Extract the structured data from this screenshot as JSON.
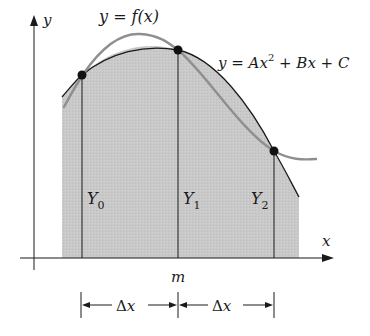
{
  "diagram": {
    "labels": {
      "y_axis": "y",
      "x_axis": "x",
      "function_label": "y = f(x)",
      "parabola_label_prefix": "y = Ax",
      "parabola_label_exp": "2",
      "parabola_label_suffix": " + Bx + C",
      "midpoint": "m",
      "ordinate_0": "Y",
      "ordinate_0_sub": "0",
      "ordinate_1": "Y",
      "ordinate_1_sub": "1",
      "ordinate_2": "Y",
      "ordinate_2_sub": "2",
      "delta_left": "Δx",
      "delta_right": "Δx"
    },
    "points": [
      {
        "name": "P0",
        "x": 82,
        "y": 75
      },
      {
        "name": "P1",
        "x": 178,
        "y": 50
      },
      {
        "name": "P2",
        "x": 274,
        "y": 151
      }
    ],
    "colors": {
      "shade": "#c8c8c8",
      "function_curve": "#8f8f8f",
      "parabola": "#1a1a1a",
      "axes": "#1a1a1a"
    }
  }
}
